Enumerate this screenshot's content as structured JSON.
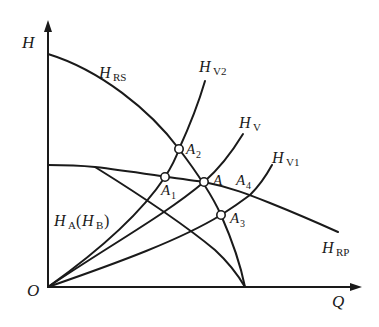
{
  "diagram": {
    "type": "pump-system characteristic curves",
    "axes": {
      "y_label": "H",
      "x_label": "Q",
      "origin_label": "O"
    },
    "curves": {
      "H_RS": {
        "main": "H",
        "sub": "RS"
      },
      "H_RP": {
        "main": "H",
        "sub": "RP"
      },
      "H_V2": {
        "main": "H",
        "sub": "V2"
      },
      "H_V": {
        "main": "H",
        "sub": "V"
      },
      "H_V1": {
        "main": "H",
        "sub": "V1"
      },
      "H_A_HB": {
        "main": "H",
        "sub": "A",
        "paren_main": "H",
        "paren_sub": "B"
      }
    },
    "points": [
      {
        "main": "A",
        "sub": "2"
      },
      {
        "main": "A",
        "sub": "1"
      },
      {
        "main": "A",
        "sub": ""
      },
      {
        "main": "A",
        "sub": "4"
      },
      {
        "main": "A",
        "sub": "3"
      }
    ],
    "colors": {
      "line": "#1a1a1a",
      "background": "#ffffff"
    }
  }
}
